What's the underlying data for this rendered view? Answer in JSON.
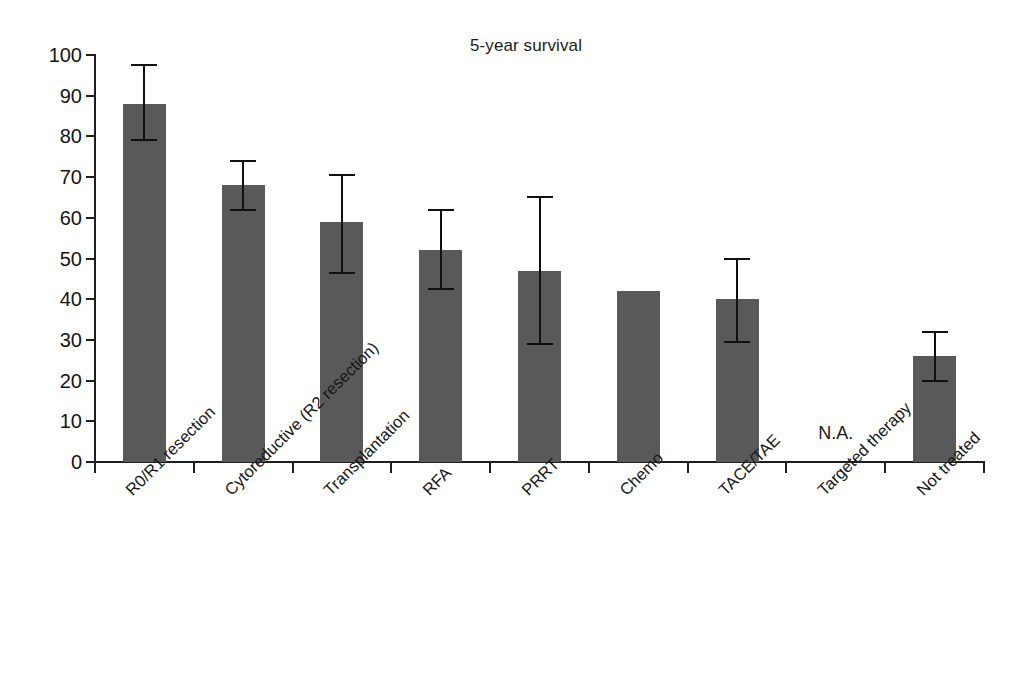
{
  "chart_data": {
    "type": "bar",
    "title": "5-year survival",
    "xlabel": "",
    "ylabel": "",
    "ylim": [
      0,
      100
    ],
    "yticks": [
      0,
      10,
      20,
      30,
      40,
      50,
      60,
      70,
      80,
      90,
      100
    ],
    "grid": false,
    "legend": null,
    "bar_color": "#595959",
    "categories": [
      "R0/R1 resection",
      "Cytoreductive (R2 resection)",
      "Transplantation",
      "RFA",
      "PRRT",
      "Chemo",
      "TACE/TAE",
      "Targeted therapy",
      "Not treated"
    ],
    "values": [
      88,
      68,
      59,
      52,
      47,
      42,
      40,
      null,
      26
    ],
    "error_low": [
      79,
      62,
      46.5,
      42.5,
      29,
      null,
      29.5,
      null,
      20
    ],
    "error_high": [
      97.5,
      74,
      70.5,
      62,
      65,
      null,
      50,
      null,
      32
    ],
    "annotations": [
      {
        "text": "N.A.",
        "category": "Targeted therapy",
        "value": 5
      }
    ]
  },
  "axis": {
    "y_tick_labels": [
      "100",
      "90",
      "80",
      "70",
      "60",
      "50",
      "40",
      "30",
      "20",
      "10",
      "0"
    ]
  }
}
